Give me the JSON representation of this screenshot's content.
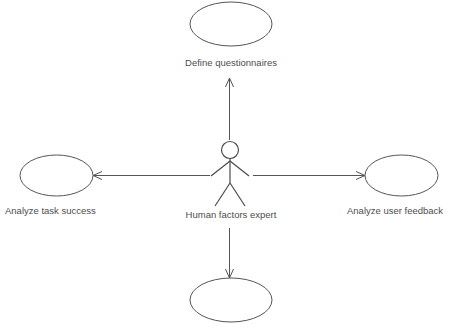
{
  "diagram": {
    "type": "uml-use-case-diagram",
    "background_color": "#ffffff",
    "line_color": "#555555",
    "text_color": "#4d4d4d",
    "actor": {
      "name": "Human factors expert",
      "label": "Human factors expert"
    },
    "use_cases": [
      {
        "id": "top",
        "label": "Define questionnaires",
        "position": "top"
      },
      {
        "id": "left",
        "label": "Analyze task success",
        "position": "left"
      },
      {
        "id": "right",
        "label": "Analyze user feedback",
        "position": "right"
      },
      {
        "id": "bottom",
        "label": "",
        "position": "bottom"
      }
    ],
    "associations": [
      {
        "from": "Human factors expert",
        "to": "Define questionnaires",
        "direction": "up"
      },
      {
        "from": "Human factors expert",
        "to": "Analyze task success",
        "direction": "left"
      },
      {
        "from": "Human factors expert",
        "to": "Analyze user feedback",
        "direction": "right"
      },
      {
        "from": "Human factors expert",
        "to": "",
        "direction": "down"
      }
    ]
  }
}
